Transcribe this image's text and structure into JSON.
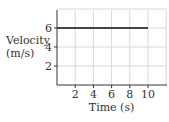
{
  "chart_data": {
    "type": "line",
    "title": "",
    "xlabel": "Time (s)",
    "ylabel_line1": "Velocity",
    "ylabel_line2": "(m/s)",
    "ylabel": "Velocity (m/s)",
    "x_ticks": [
      2,
      4,
      6,
      8,
      10
    ],
    "y_ticks": [
      2,
      4,
      6
    ],
    "xlim": [
      0,
      12
    ],
    "ylim": [
      0,
      8
    ],
    "grid": true,
    "series": [
      {
        "name": "velocity",
        "x": [
          0,
          10
        ],
        "y": [
          6,
          6
        ],
        "color": "#444444"
      }
    ]
  }
}
